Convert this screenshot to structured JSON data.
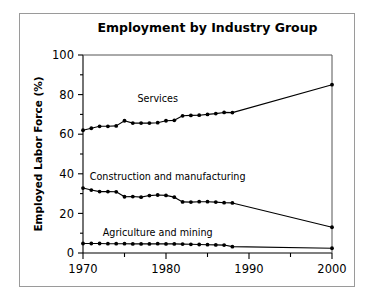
{
  "figure": {
    "title": "Employment by Industry Group",
    "background_color": "#ffffff",
    "frame_color": "#9a9a9a",
    "ink_color": "#000000"
  },
  "chart_data": {
    "type": "line",
    "title": "Employment by Industry Group",
    "xlabel": "",
    "ylabel": "Employed Labor Force (%)",
    "xlim": [
      1970,
      2000
    ],
    "ylim": [
      0,
      100
    ],
    "grid": false,
    "legend_position": "inline-annotations",
    "x_ticks": [
      1970,
      1980,
      1990,
      2000
    ],
    "x_tick_labels": [
      "1970",
      "1980",
      "1990",
      "2000"
    ],
    "x_minor_ticks": [
      1975,
      1985,
      1995
    ],
    "y_ticks": [
      0,
      20,
      40,
      60,
      80,
      100
    ],
    "y_tick_labels": [
      "0",
      "20",
      "40",
      "60",
      "80",
      "100"
    ],
    "y_minor_ticks": [
      10,
      30,
      50,
      70,
      90
    ],
    "series": [
      {
        "name": "Services",
        "label": "Services",
        "label_x": 1979.0,
        "label_y": 76.5,
        "marker": "dot",
        "x": [
          1970,
          1971,
          1972,
          1973,
          1974,
          1975,
          1976,
          1977,
          1978,
          1979,
          1980,
          1981,
          1982,
          1983,
          1984,
          1985,
          1986,
          1987,
          1988,
          2000
        ],
        "y": [
          62.0,
          63.0,
          64.0,
          64.0,
          64.2,
          66.8,
          65.6,
          65.6,
          65.6,
          65.8,
          66.8,
          67.0,
          69.3,
          69.5,
          69.6,
          70.0,
          70.4,
          71.0,
          70.9,
          85.0
        ]
      },
      {
        "name": "Construction and manufacturing",
        "label": "Construction and manufacturing",
        "label_x": 1980.2,
        "label_y": 37.0,
        "marker": "dot",
        "x": [
          1970,
          1971,
          1972,
          1973,
          1974,
          1975,
          1976,
          1977,
          1978,
          1979,
          1980,
          1981,
          1982,
          1983,
          1984,
          1985,
          1986,
          1987,
          1988,
          2000
        ],
        "y": [
          32.8,
          31.8,
          31.0,
          31.0,
          30.9,
          28.4,
          28.5,
          28.2,
          29.0,
          29.3,
          29.1,
          28.2,
          25.8,
          25.7,
          25.9,
          25.9,
          25.7,
          25.4,
          25.3,
          13.0
        ]
      },
      {
        "name": "Agriculture and mining",
        "label": "Agriculture and mining",
        "label_x": 1979.0,
        "label_y": 8.5,
        "marker": "dot",
        "x": [
          1970,
          1971,
          1972,
          1973,
          1974,
          1975,
          1976,
          1977,
          1978,
          1979,
          1980,
          1981,
          1982,
          1983,
          1984,
          1985,
          1986,
          1987,
          1988,
          2000
        ],
        "y": [
          4.8,
          4.8,
          4.8,
          4.7,
          4.7,
          4.7,
          4.6,
          4.6,
          4.6,
          4.7,
          4.6,
          4.6,
          4.5,
          4.4,
          4.3,
          4.2,
          4.1,
          4.0,
          3.2,
          2.4
        ]
      }
    ]
  }
}
